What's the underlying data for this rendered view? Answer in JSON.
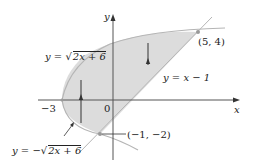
{
  "figure": {
    "axes": {
      "x_label": "x",
      "y_label": "y",
      "origin_label": "0",
      "x_tick_label": "−3"
    },
    "curves": {
      "upper": {
        "lhs": "y = ",
        "radical": "2x + 6",
        "prefix": ""
      },
      "lower": {
        "lhs": "y = −",
        "radical": "2x + 6",
        "prefix": "−"
      },
      "line": "y = x − 1"
    },
    "points": {
      "top": "(5, 4)",
      "bottom": "(−1, −2)"
    },
    "colors": {
      "fill": "#dcdcdc",
      "curve": "#b5b5b5",
      "axis": "#555555",
      "text": "#222222"
    }
  }
}
